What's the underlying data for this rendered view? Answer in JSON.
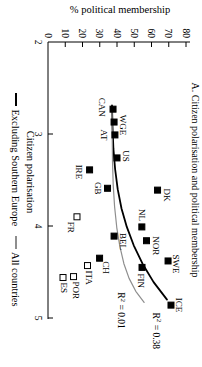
{
  "title": "A. Citizen polarisation and political membership",
  "axes": {
    "y_label": "% political membership",
    "x_label": "Citizen polarisation",
    "x_ticks": [
      2,
      3,
      4,
      5
    ],
    "y_ticks": [
      0,
      10,
      20,
      30,
      40,
      50,
      60,
      70,
      80
    ]
  },
  "legend": [
    {
      "label": "Excluding Southern Europe",
      "color": "#000000"
    },
    {
      "label": "All countries",
      "color": "#8e8e8e"
    }
  ],
  "colors": {
    "black_line": "#000000",
    "gray_line": "#8e8e8e"
  },
  "chart_data": {
    "type": "scatter",
    "title": "A. Citizen polarisation and political membership",
    "xlabel": "Citizen polarisation",
    "ylabel": "% political membership",
    "xlim": [
      2,
      5
    ],
    "ylim": [
      0,
      80
    ],
    "grid": false,
    "legend_position": "bottom",
    "orientation_note": "figure rotated 90deg clockwise on page",
    "points": [
      {
        "label": "CAN",
        "x": 2.73,
        "y": 37.7,
        "filled": true,
        "anchor": "middle",
        "dx": -2,
        "dy": 14
      },
      {
        "label": "WGE",
        "x": 2.87,
        "y": 38.3,
        "filled": true,
        "anchor": "middle",
        "dx": 3,
        "dy": -6
      },
      {
        "label": "AT",
        "x": 3.01,
        "y": 38.8,
        "filled": true,
        "anchor": "middle",
        "dx": 0,
        "dy": 14
      },
      {
        "label": "US",
        "x": 3.26,
        "y": 40.0,
        "filled": true,
        "anchor": "middle",
        "dx": -2,
        "dy": -6
      },
      {
        "label": "IRE",
        "x": 3.39,
        "y": 24.1,
        "filled": true,
        "anchor": "middle",
        "dx": 2,
        "dy": 14
      },
      {
        "label": "GB",
        "x": 3.59,
        "y": 34.5,
        "filled": true,
        "anchor": "middle",
        "dx": 0,
        "dy": 13
      },
      {
        "label": "DK",
        "x": 3.61,
        "y": 63.5,
        "filled": true,
        "anchor": "middle",
        "dx": 5,
        "dy": -6
      },
      {
        "label": "FR",
        "x": 3.9,
        "y": 16.8,
        "filled": false,
        "anchor": "start",
        "dx": 5,
        "dy": 9
      },
      {
        "label": "NL",
        "x": 4.01,
        "y": 54.4,
        "filled": true,
        "anchor": "end",
        "dx": -6,
        "dy": 3
      },
      {
        "label": "BEL",
        "x": 4.11,
        "y": 38.3,
        "filled": true,
        "anchor": "start",
        "dx": -3,
        "dy": -6
      },
      {
        "label": "NOR",
        "x": 4.16,
        "y": 57.1,
        "filled": true,
        "anchor": "middle",
        "dx": 5,
        "dy": -6
      },
      {
        "label": "CH",
        "x": 4.35,
        "y": 29.9,
        "filled": true,
        "anchor": "start",
        "dx": 3,
        "dy": -3
      },
      {
        "label": "SWE",
        "x": 4.38,
        "y": 69.6,
        "filled": true,
        "anchor": "middle",
        "dx": 3,
        "dy": -5
      },
      {
        "label": "ITA",
        "x": 4.43,
        "y": 22.9,
        "filled": false,
        "anchor": "start",
        "dx": 5,
        "dy": 2
      },
      {
        "label": "FIN",
        "x": 4.45,
        "y": 54.5,
        "filled": true,
        "anchor": "start",
        "dx": 6,
        "dy": 4
      },
      {
        "label": "POR",
        "x": 4.55,
        "y": 14.8,
        "filled": false,
        "anchor": "start",
        "dx": 5,
        "dy": 1
      },
      {
        "label": "ES",
        "x": 4.56,
        "y": 8.7,
        "filled": false,
        "anchor": "start",
        "dx": 5,
        "dy": 2
      },
      {
        "label": "ICE",
        "x": 4.86,
        "y": 71.3,
        "filled": true,
        "anchor": "middle",
        "dx": 0,
        "dy": -5
      }
    ],
    "trend_lines": [
      {
        "name": "Excluding Southern Europe",
        "color": "#000000",
        "width": 1.8,
        "r2_text": {
          "base": "R",
          "sup": "2",
          "rest": " = 0.38",
          "x": 4.94,
          "y": 61
        },
        "points": [
          [
            2.69,
            37.1
          ],
          [
            2.92,
            37.4
          ],
          [
            3.16,
            37.9
          ],
          [
            3.38,
            38.9
          ],
          [
            3.6,
            40.4
          ],
          [
            3.81,
            42.6
          ],
          [
            4.01,
            45.7
          ],
          [
            4.21,
            49.7
          ],
          [
            4.41,
            54.8
          ],
          [
            4.61,
            61.2
          ],
          [
            4.8,
            69.0
          ]
        ]
      },
      {
        "name": "All countries",
        "color": "#8e8e8e",
        "width": 1.2,
        "r2_text": {
          "base": "R",
          "sup": "2",
          "rest": " = 0.01",
          "x": 4.72,
          "y": 40.5
        },
        "points": [
          [
            2.72,
            37.1
          ],
          [
            3.01,
            37.2
          ],
          [
            3.29,
            37.4
          ],
          [
            3.55,
            37.8
          ],
          [
            3.79,
            38.6
          ],
          [
            4.02,
            39.9
          ],
          [
            4.22,
            41.6
          ],
          [
            4.41,
            44.0
          ],
          [
            4.57,
            47.0
          ],
          [
            4.71,
            50.9
          ],
          [
            4.83,
            55.7
          ]
        ]
      }
    ]
  }
}
